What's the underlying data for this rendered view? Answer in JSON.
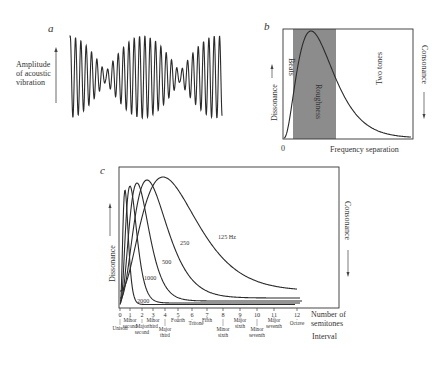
{
  "panel_a": {
    "label": "a",
    "ylabel_lines": [
      "Amplitude",
      "of acoustic",
      "vibration"
    ]
  },
  "panel_b": {
    "label": "b",
    "ylabel_left": "Dissonance",
    "ylabel_right": "Consonance",
    "xlabel": "Frequency separation",
    "origin": "0",
    "region_beats": "Beats",
    "region_roughness": "Roughness",
    "region_two_tones": "Two tones",
    "band_color": "#8c8c8c"
  },
  "panel_c": {
    "label": "c",
    "ylabel_left": "Dissonance",
    "ylabel_right": "Consonance",
    "xlabel_lines": [
      "Number of",
      "semitones"
    ],
    "interval_label": "Interval",
    "curve_labels": [
      "125 Hz",
      "250",
      "500",
      "1000",
      "2000"
    ],
    "ticks": [
      "0",
      "1",
      "2",
      "3",
      "4",
      "5",
      "6",
      "7",
      "8",
      "9",
      "10",
      "11",
      "12"
    ],
    "intervals": [
      {
        "lines": [
          "Unison"
        ]
      },
      {
        "lines": [
          "Minor",
          "second"
        ]
      },
      {
        "lines": [
          "Major",
          "second"
        ]
      },
      {
        "lines": [
          "Minor",
          "third"
        ]
      },
      {
        "lines": [
          "Major",
          "third"
        ]
      },
      {
        "lines": [
          "Fourth"
        ]
      },
      {
        "lines": [
          "Tritone"
        ]
      },
      {
        "lines": [
          "Fifth"
        ]
      },
      {
        "lines": [
          "Minor",
          "sixth"
        ]
      },
      {
        "lines": [
          "Major",
          "sixth"
        ]
      },
      {
        "lines": [
          "Minor",
          "seventh"
        ]
      },
      {
        "lines": [
          "Major",
          "seventh"
        ]
      },
      {
        "lines": [
          "Octave"
        ]
      }
    ]
  }
}
